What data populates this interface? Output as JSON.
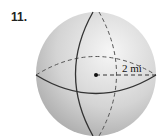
{
  "problem": {
    "number": "11."
  },
  "figure": {
    "shape": "sphere",
    "radius_label": "2 mi",
    "colors": {
      "fill_light": "#f4f4f4",
      "fill_dark": "#b8b8b8",
      "line": "#333333"
    }
  }
}
